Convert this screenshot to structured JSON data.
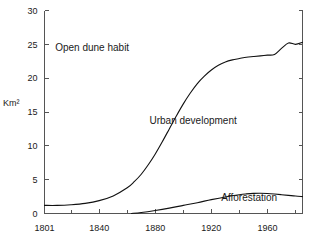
{
  "chart_data": {
    "type": "line",
    "title": "",
    "subtitle": "",
    "xlabel": "",
    "ylabel": "Km²",
    "xlim": [
      1801,
      1985
    ],
    "ylim": [
      0,
      30
    ],
    "grid": false,
    "legend_position": "inline-annotations",
    "x_ticks_major": [
      1801,
      1840,
      1880,
      1920,
      1960
    ],
    "x_ticks_major_labels": [
      "1801",
      "1840",
      "1880",
      "1920",
      "1960"
    ],
    "x_ticks_minor": [
      1820,
      1860,
      1900,
      1940,
      1980
    ],
    "y_ticks": [
      0,
      5,
      10,
      15,
      20,
      25,
      30
    ],
    "y_tick_labels": [
      "0",
      "5",
      "10",
      "15",
      "20",
      "25",
      "30"
    ],
    "annotations": [
      {
        "text": "Open dune habit",
        "x": 1835,
        "y": 24.0
      },
      {
        "text": "Urban development",
        "x": 1907,
        "y": 13.2
      },
      {
        "text": "Afforestation",
        "x": 1947,
        "y": 1.9
      }
    ],
    "series": [
      {
        "name": "Urban development boundary",
        "x": [
          1801,
          1810,
          1820,
          1830,
          1840,
          1850,
          1860,
          1865,
          1870,
          1875,
          1880,
          1885,
          1890,
          1895,
          1900,
          1905,
          1910,
          1915,
          1920,
          1925,
          1930,
          1935,
          1940,
          1945,
          1950,
          1955,
          1960,
          1965,
          1970,
          1975,
          1980,
          1985
        ],
        "values": [
          1.2,
          1.2,
          1.3,
          1.5,
          1.9,
          2.6,
          3.8,
          4.7,
          5.8,
          7.2,
          8.8,
          10.6,
          12.5,
          14.4,
          16.2,
          17.8,
          19.2,
          20.3,
          21.2,
          21.9,
          22.4,
          22.7,
          22.9,
          23.1,
          23.2,
          23.3,
          23.4,
          23.5,
          24.4,
          25.2,
          25.0,
          25.3
        ]
      },
      {
        "name": "Afforestation",
        "x": [
          1863,
          1870,
          1880,
          1890,
          1900,
          1910,
          1920,
          1930,
          1940,
          1945,
          1950,
          1955,
          1960,
          1965,
          1970,
          1975,
          1980,
          1985
        ],
        "values": [
          0.0,
          0.15,
          0.45,
          0.8,
          1.2,
          1.6,
          2.05,
          2.45,
          2.78,
          2.9,
          2.98,
          3.0,
          2.96,
          2.88,
          2.78,
          2.68,
          2.58,
          2.5
        ]
      }
    ]
  },
  "axis": {
    "y_title": "Km²"
  }
}
